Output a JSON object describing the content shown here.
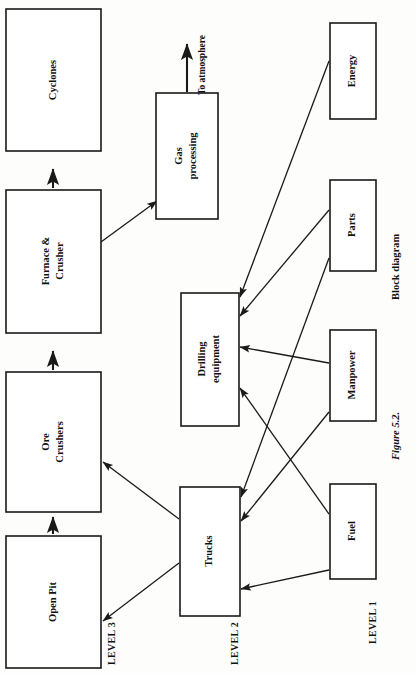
{
  "figure": {
    "number": "Figure 5.2.",
    "caption": "Block diagram",
    "orientation": "rotated-90-ccw",
    "background_color": "#fdfdfb",
    "line_color": "#1a1a1a"
  },
  "levels": [
    {
      "id": "level-3",
      "label": "LEVEL 3"
    },
    {
      "id": "level-2",
      "label": "LEVEL 2"
    },
    {
      "id": "level-1",
      "label": "LEVEL 1"
    }
  ],
  "annotations": [
    {
      "id": "to-atmosphere",
      "label": "To atmosphere"
    }
  ],
  "nodes": [
    {
      "id": "cyclones",
      "label": "Cyclones",
      "level": "level-3",
      "x": 6,
      "y": 9,
      "w": 95,
      "h": 142
    },
    {
      "id": "furnace-crusher",
      "label": "Furnace &\nCrusher",
      "level": "level-3",
      "x": 6,
      "y": 190,
      "w": 95,
      "h": 143
    },
    {
      "id": "ore-crushers",
      "label": "Ore\nCrushers",
      "level": "level-3",
      "x": 6,
      "y": 372,
      "w": 95,
      "h": 140
    },
    {
      "id": "open-pit",
      "label": "Open Pit",
      "level": "level-3",
      "x": 6,
      "y": 536,
      "w": 95,
      "h": 132
    },
    {
      "id": "gas-processing",
      "label": "Gas\nprocessing",
      "level": "level-2",
      "x": 156,
      "y": 93,
      "w": 62,
      "h": 126
    },
    {
      "id": "drilling-equipment",
      "label": "Drilling\nequipment",
      "level": "level-2",
      "x": 181,
      "y": 293,
      "w": 58,
      "h": 133
    },
    {
      "id": "trucks",
      "label": "Trucks",
      "level": "level-2",
      "x": 180,
      "y": 487,
      "w": 60,
      "h": 129
    },
    {
      "id": "energy",
      "label": "Energy",
      "level": "level-1",
      "x": 330,
      "y": 23,
      "w": 46,
      "h": 96
    },
    {
      "id": "parts",
      "label": "Parts",
      "level": "level-1",
      "x": 330,
      "y": 180,
      "w": 46,
      "h": 91
    },
    {
      "id": "manpower",
      "label": "Manpower",
      "level": "level-1",
      "x": 330,
      "y": 330,
      "w": 46,
      "h": 91
    },
    {
      "id": "fuel",
      "label": "Fuel",
      "level": "level-1",
      "x": 330,
      "y": 484,
      "w": 46,
      "h": 95
    }
  ],
  "edges": [
    {
      "id": "edge-furnace-to-cyclones",
      "from": "furnace-crusher",
      "to": "cyclones",
      "arrow": true
    },
    {
      "id": "edge-ore-to-furnace",
      "from": "ore-crushers",
      "to": "furnace-crusher",
      "arrow": true
    },
    {
      "id": "edge-openpit-to-ore",
      "from": "open-pit",
      "to": "ore-crushers",
      "arrow": true
    },
    {
      "id": "edge-furnace-to-gas",
      "from": "furnace-crusher",
      "to": "gas-processing",
      "arrow": true
    },
    {
      "id": "edge-gas-to-atmosphere",
      "from": "gas-processing",
      "to": "to-atmosphere",
      "arrow": true
    },
    {
      "id": "edge-trucks-to-ore",
      "from": "trucks",
      "to": "ore-crushers",
      "arrow": true
    },
    {
      "id": "edge-trucks-to-openpit",
      "from": "trucks",
      "to": "open-pit",
      "arrow": true
    },
    {
      "id": "edge-energy-to-drilling",
      "from": "energy",
      "to": "drilling-equipment",
      "arrow": true
    },
    {
      "id": "edge-parts-to-drilling",
      "from": "parts",
      "to": "drilling-equipment",
      "arrow": true
    },
    {
      "id": "edge-manpower-to-drilling",
      "from": "manpower",
      "to": "drilling-equipment",
      "arrow": true
    },
    {
      "id": "edge-fuel-to-drilling",
      "from": "fuel",
      "to": "drilling-equipment",
      "arrow": true
    },
    {
      "id": "edge-parts-to-trucks",
      "from": "parts",
      "to": "trucks",
      "arrow": true
    },
    {
      "id": "edge-manpower-to-trucks",
      "from": "manpower",
      "to": "trucks",
      "arrow": true
    },
    {
      "id": "edge-fuel-to-trucks",
      "from": "fuel",
      "to": "trucks",
      "arrow": true
    }
  ]
}
